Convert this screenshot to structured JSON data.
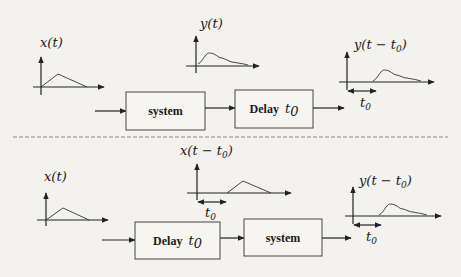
{
  "diagram": {
    "top_row": {
      "input_label": "x(t)",
      "intermediate_label": "y(t)",
      "output_label_main": "y(t − t",
      "output_label_sub": "0",
      "output_label_close": ")",
      "block1": "system",
      "block2_text": "Delay",
      "block2_symbol": "t",
      "block2_sub": "0",
      "shift_label": "t",
      "shift_sub": "0"
    },
    "bottom_row": {
      "input_label": "x(t)",
      "intermediate_label_main": "x(t − t",
      "intermediate_label_sub": "0",
      "intermediate_label_close": ")",
      "intermediate_shift_label": "t",
      "intermediate_shift_sub": "0",
      "block1_text": "Delay",
      "block1_symbol": "t",
      "block1_sub": "0",
      "block2": "system",
      "output_label_main": "y(t − t",
      "output_label_sub": "0",
      "output_label_close": ")",
      "shift_label": "t",
      "shift_sub": "0"
    },
    "colors": {
      "background": "#f3f2ef",
      "lines": "#222222",
      "divider": "#888888"
    }
  }
}
